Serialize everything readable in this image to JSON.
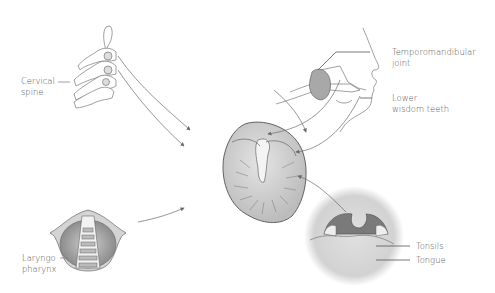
{
  "diagram": {
    "center": {
      "name": "Ear (auricle)"
    },
    "sources": [
      {
        "id": "cervical_spine",
        "line1": "Cervical",
        "line2": "spine"
      },
      {
        "id": "tmj",
        "line1": "Temporomandibular",
        "line2": "joint"
      },
      {
        "id": "wisdom_teeth",
        "line1": "Lower",
        "line2": "wisdom teeth"
      },
      {
        "id": "laryngopharynx",
        "line1": "Laryngo",
        "line2": "pharynx"
      },
      {
        "id": "tonsils",
        "line1": "Tonsils"
      },
      {
        "id": "tongue",
        "line1": "Tongue"
      }
    ],
    "colors": {
      "line": "#6a6a6a",
      "fill_gray": "#bdbdbd",
      "fill_dark": "#8a8a8a",
      "text": "#555555"
    }
  }
}
